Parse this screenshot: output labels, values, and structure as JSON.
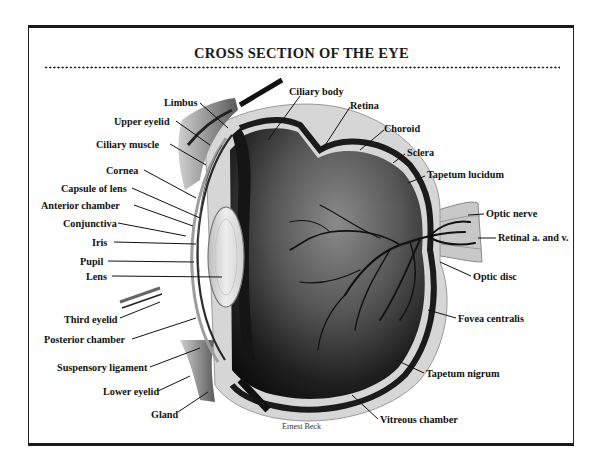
{
  "title": "CROSS SECTION OF THE EYE",
  "credit": "Ernest Beck",
  "labels_left": [
    {
      "id": "limbus",
      "text": "Limbus"
    },
    {
      "id": "upper-eyelid",
      "text": "Upper eyelid"
    },
    {
      "id": "ciliary-muscle",
      "text": "Ciliary muscle"
    },
    {
      "id": "cornea",
      "text": "Cornea"
    },
    {
      "id": "capsule-of-lens",
      "text": "Capsule of lens"
    },
    {
      "id": "anterior-chamber",
      "text": "Anterior chamber"
    },
    {
      "id": "conjunctiva",
      "text": "Conjunctiva"
    },
    {
      "id": "iris",
      "text": "Iris"
    },
    {
      "id": "pupil",
      "text": "Pupil"
    },
    {
      "id": "lens",
      "text": "Lens"
    },
    {
      "id": "third-eyelid",
      "text": "Third eyelid"
    },
    {
      "id": "posterior-chamber",
      "text": "Posterior chamber"
    },
    {
      "id": "suspensory-ligament",
      "text": "Suspensory ligament"
    },
    {
      "id": "lower-eyelid",
      "text": "Lower eyelid"
    },
    {
      "id": "gland",
      "text": "Gland"
    }
  ],
  "labels_right": [
    {
      "id": "ciliary-body",
      "text": "Ciliary body"
    },
    {
      "id": "retina",
      "text": "Retina"
    },
    {
      "id": "choroid",
      "text": "Choroid"
    },
    {
      "id": "sclera",
      "text": "Sclera"
    },
    {
      "id": "tapetum-lucidum",
      "text": "Tapetum lucidum"
    },
    {
      "id": "optic-nerve",
      "text": "Optic nerve"
    },
    {
      "id": "retinal-a-and-v",
      "text": "Retinal a. and v."
    },
    {
      "id": "optic-disc",
      "text": "Optic disc"
    },
    {
      "id": "fovea-centralis",
      "text": "Fovea centralis"
    },
    {
      "id": "tapetum-nigrum",
      "text": "Tapetum nigrum"
    },
    {
      "id": "vitreous-chamber",
      "text": "Vitreous chamber"
    }
  ]
}
